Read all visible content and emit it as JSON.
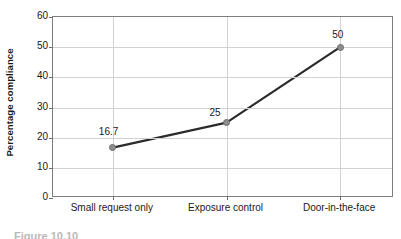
{
  "chart_data": {
    "type": "line",
    "title": "",
    "xlabel": "",
    "ylabel": "Percentage compliance",
    "categories": [
      "Small request only",
      "Exposure control",
      "Door-in-the-face"
    ],
    "values": [
      16.7,
      25,
      50
    ],
    "point_labels": [
      "16.7",
      "25",
      "50"
    ],
    "ylim": [
      0,
      60
    ],
    "y_ticks": [
      0,
      10,
      20,
      30,
      40,
      50,
      60
    ],
    "y_tick_labels": [
      "0",
      "10",
      "20",
      "30",
      "40",
      "50",
      "60"
    ],
    "grid": "horizontal-and-category-verticals",
    "legend": "none",
    "series": [
      {
        "name": "Percentage compliance",
        "values": [
          16.7,
          25,
          50
        ]
      }
    ],
    "colors": {
      "line": "#2b2b2b",
      "marker_fill": "#8f8f8f",
      "marker_edge": "#6b6b6b",
      "gridline": "#d2d2d2",
      "frame": "#7d7d7d",
      "text": "#1a1a1a",
      "background": "#ffffff"
    }
  },
  "caption": {
    "clipped_text": "Figure 10.10"
  }
}
